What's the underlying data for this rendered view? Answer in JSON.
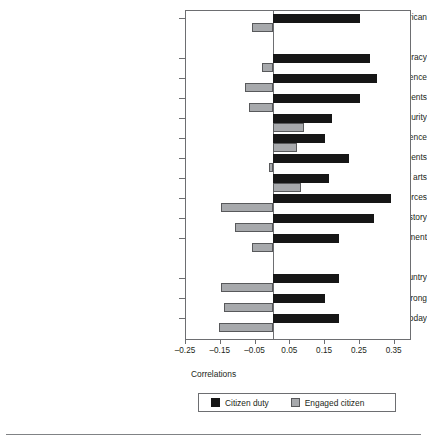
{
  "chart_data": {
    "type": "bar",
    "orientation": "horizontal",
    "title": "",
    "xlabel": "Correlations",
    "ylabel": "",
    "xlim": [
      -0.25,
      0.4
    ],
    "xticks": [
      -0.25,
      -0.15,
      -0.05,
      0.05,
      0.15,
      0.25,
      0.35
    ],
    "xtick_labels": [
      "–0.25",
      "–0.15",
      "–0.05",
      "0.05",
      "0.15",
      "0.25",
      "0.35"
    ],
    "grid": false,
    "legend_position": "bottom",
    "categories": [
      "Proud to be American",
      "Proud of democracy",
      "Proud of world influence",
      "Proud of economic achievements",
      "Proud of social security",
      "Proud of science",
      "Proud of sports achievements",
      "Proud of arts",
      "Proud of armed forces",
      "Proud of history",
      "Proud of fair/equal treatment",
      "America is a better country",
      "Should support country even if wrong",
      "Not ashamed about things in American today"
    ],
    "series": [
      {
        "name": "Citizen duty",
        "color": "#161616",
        "values": [
          0.25,
          0.28,
          0.3,
          0.25,
          0.17,
          0.15,
          0.22,
          0.16,
          0.34,
          0.29,
          0.19,
          0.19,
          0.15,
          0.19
        ]
      },
      {
        "name": "Engaged citizen",
        "color": "#a7a9ac",
        "values": [
          -0.06,
          -0.03,
          -0.08,
          -0.07,
          0.09,
          0.07,
          -0.01,
          0.08,
          -0.15,
          -0.11,
          -0.06,
          -0.15,
          -0.14,
          -0.155
        ]
      }
    ]
  },
  "legend": {
    "items": [
      {
        "label": "Citizen duty",
        "swatch": "black-square-swatch"
      },
      {
        "label": "Engaged citizen",
        "swatch": "gray-square-swatch"
      }
    ]
  },
  "axis": {
    "x_title": "Correlations"
  }
}
